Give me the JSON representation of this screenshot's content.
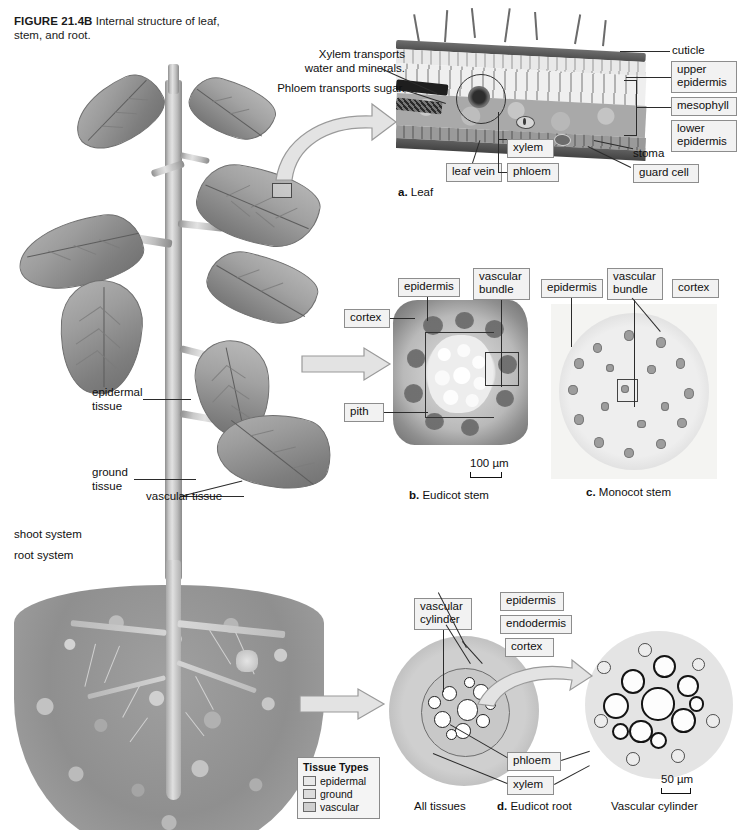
{
  "figure": {
    "label": "FIGURE 21.4B",
    "caption": "Internal structure of leaf, stem, and root."
  },
  "plant": {
    "labels": {
      "epidermal_tissue": "epidermal\ntissue",
      "ground_tissue": "ground\ntissue",
      "vascular_tissue": "vascular tissue",
      "shoot_system": "shoot system",
      "root_system": "root system"
    }
  },
  "tissue_legend": {
    "title": "Tissue Types",
    "items": [
      {
        "label": "epidermal",
        "color": "#e8e8e8"
      },
      {
        "label": "ground",
        "color": "#dcdcdc"
      },
      {
        "label": "vascular",
        "color": "#cfcfcf"
      }
    ]
  },
  "panel_a_leaf": {
    "caption_letter": "a.",
    "caption_text": "Leaf",
    "statements": {
      "xylem": "Xylem transports\nwater and minerals.",
      "phloem": "Phloem transports sugar."
    },
    "labels": {
      "cuticle": "cuticle",
      "upper_epidermis": "upper\nepidermis",
      "mesophyll": "mesophyll",
      "lower_epidermis": "lower\nepidermis",
      "stoma": "stoma",
      "guard_cell": "guard cell",
      "leaf_vein": "leaf vein",
      "xylem": "xylem",
      "phloem": "phloem"
    }
  },
  "panel_b_eudicot_stem": {
    "caption_letter": "b.",
    "caption_text": "Eudicot stem",
    "labels": {
      "epidermis": "epidermis",
      "cortex": "cortex",
      "vascular_bundle": "vascular\nbundle",
      "pith": "pith"
    },
    "scale_bar": "100 µm"
  },
  "panel_c_monocot_stem": {
    "caption_letter": "c.",
    "caption_text": "Monocot stem",
    "labels": {
      "epidermis": "epidermis",
      "vascular_bundle": "vascular\nbundle",
      "cortex": "cortex"
    }
  },
  "panel_d_eudicot_root": {
    "caption_letter": "d.",
    "caption_text": "Eudicot root",
    "labels": {
      "vascular_cylinder": "vascular\ncylinder",
      "epidermis": "epidermis",
      "endodermis": "endodermis",
      "cortex": "cortex",
      "phloem": "phloem",
      "xylem": "xylem"
    },
    "sub_caption_left": "All tissues",
    "sub_caption_right": "Vascular cylinder",
    "scale_bar": "50 µm"
  }
}
